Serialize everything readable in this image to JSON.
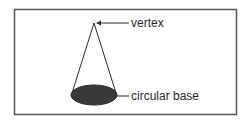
{
  "diagram": {
    "labels": {
      "vertex": "vertex",
      "base": "circular base"
    },
    "colors": {
      "stroke": "#2a2a2a",
      "base_fill": "#3a3a3a",
      "border": "#555555"
    }
  }
}
